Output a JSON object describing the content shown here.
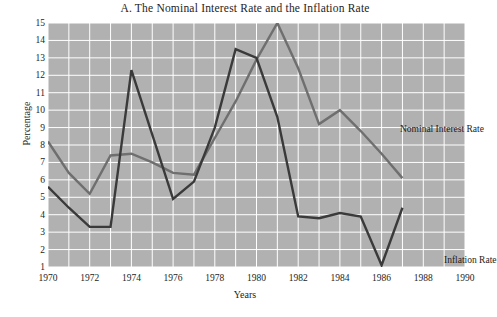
{
  "chart_data": {
    "type": "line",
    "title": "A. The Nominal Interest Rate and the Inflation Rate",
    "xlabel": "Years",
    "ylabel": "Percentage",
    "xlim": [
      1970,
      1990
    ],
    "ylim": [
      1,
      15
    ],
    "grid": true,
    "legend": "inline-annotations",
    "x_ticks": [
      1970,
      1972,
      1974,
      1976,
      1978,
      1980,
      1982,
      1984,
      1986,
      1988,
      1990
    ],
    "y_ticks": [
      1,
      2,
      3,
      4,
      5,
      6,
      7,
      8,
      9,
      10,
      11,
      12,
      13,
      14,
      15
    ],
    "x": [
      1970,
      1971,
      1972,
      1973,
      1974,
      1975,
      1976,
      1977,
      1978,
      1979,
      1980,
      1981,
      1982,
      1983,
      1984,
      1985,
      1986,
      1987
    ],
    "series": [
      {
        "name": "Nominal Interest Rate",
        "color": "#6f6f6f",
        "values": [
          8.2,
          6.4,
          5.2,
          7.4,
          7.5,
          7.0,
          6.4,
          6.3,
          8.4,
          10.5,
          12.9,
          15.0,
          12.4,
          9.2,
          10.0,
          8.8,
          7.5,
          6.1
        ]
      },
      {
        "name": "Inflation Rate",
        "color": "#3a3a3a",
        "values": [
          5.6,
          4.4,
          3.3,
          3.3,
          12.3,
          8.6,
          4.9,
          5.9,
          9.0,
          13.5,
          13.0,
          9.6,
          3.9,
          3.8,
          4.1,
          3.9,
          1.1,
          4.4
        ]
      }
    ],
    "annotations": [
      {
        "text": "Nominal Interest Rate",
        "x": 1986.0,
        "y": 10.6
      },
      {
        "text": "Inflation Rate",
        "x": 1988.1,
        "y": 3.1
      }
    ],
    "style": {
      "plot_background": "#b1b1b1",
      "gridline_color": "#ffffff",
      "page_background": "#ffffff",
      "text_color": "#1d1d1d"
    }
  }
}
